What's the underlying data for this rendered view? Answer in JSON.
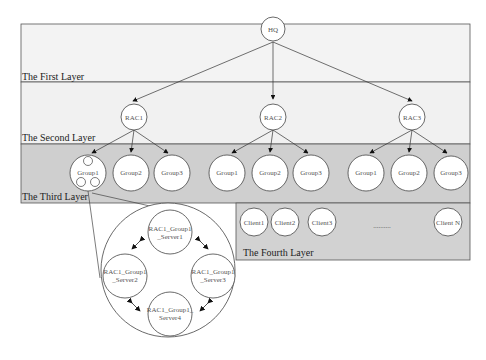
{
  "diagram": {
    "type": "hierarchical-architecture",
    "colors": {
      "layer1_bg": "#f3f3f3",
      "layer2_bg": "#f1f1f1",
      "layer3_bg": "#cfcfcf",
      "layer4_bg": "#d2d2d2",
      "border": "#555555",
      "node_fill": "#ffffff"
    },
    "layers": [
      {
        "label": "The First Layer"
      },
      {
        "label": "The Second Layer"
      },
      {
        "label": "The Third Layer"
      },
      {
        "label": "The Fourth Layer"
      }
    ],
    "hq": {
      "label": "HQ"
    },
    "racs": [
      {
        "label": "RAC1",
        "groups": [
          "Group1",
          "Group2",
          "Group3"
        ]
      },
      {
        "label": "RAC2",
        "groups": [
          "Group1",
          "Group2",
          "Group3"
        ]
      },
      {
        "label": "RAC3",
        "groups": [
          "Group1",
          "Group2",
          "Group3"
        ]
      }
    ],
    "clients": [
      "Client1",
      "Client2",
      "Client3",
      "Client N"
    ],
    "clients_ellipsis": "..........",
    "servers": [
      {
        "line1": "RAC1_Group1",
        "line2": "_Server1"
      },
      {
        "line1": "RAC1_Group1",
        "line2": "_Server2"
      },
      {
        "line1": "RAC1_Group1",
        "line2": "_Server3"
      },
      {
        "line1": "RAC1_Group1_",
        "line2": "Server4"
      }
    ]
  }
}
